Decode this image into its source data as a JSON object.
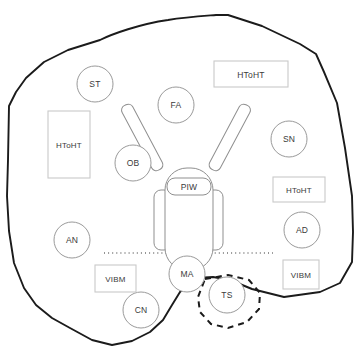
{
  "diagram": {
    "type": "spatial-zone-layout-diagram",
    "canvas": {
      "width": 361,
      "height": 359
    },
    "center_unit": {
      "name": "robot-platform",
      "label": "PIW",
      "parts": [
        "left-wheel",
        "right-wheel",
        "body",
        "head",
        "left-arm",
        "right-arm",
        "label-plate"
      ]
    },
    "circle_nodes": [
      {
        "id": "st",
        "label": "ST",
        "cx": 95,
        "cy": 84,
        "r": 18
      },
      {
        "id": "fa",
        "label": "FA",
        "cx": 176,
        "cy": 105,
        "r": 18
      },
      {
        "id": "ob",
        "label": "OB",
        "cx": 133,
        "cy": 163,
        "r": 18
      },
      {
        "id": "sn",
        "label": "SN",
        "cx": 289,
        "cy": 139,
        "r": 18
      },
      {
        "id": "an",
        "label": "AN",
        "cx": 72,
        "cy": 240,
        "r": 18
      },
      {
        "id": "ad",
        "label": "AD",
        "cx": 302,
        "cy": 230,
        "r": 18
      },
      {
        "id": "ma",
        "label": "MA",
        "cx": 187,
        "cy": 274,
        "r": 18
      },
      {
        "id": "ts",
        "label": "TS",
        "cx": 227,
        "cy": 295,
        "r": 18
      },
      {
        "id": "cn",
        "label": "CN",
        "cx": 141,
        "cy": 310,
        "r": 18
      }
    ],
    "box_nodes": [
      {
        "id": "htoht-top",
        "label": "HToHT",
        "x": 214,
        "y": 61,
        "w": 74,
        "h": 26
      },
      {
        "id": "htoht-left",
        "label": "HToHT",
        "x": 48,
        "y": 111,
        "w": 42,
        "h": 67
      },
      {
        "id": "htoht-right",
        "label": "HToHT",
        "x": 273,
        "y": 177,
        "w": 52,
        "h": 25
      },
      {
        "id": "vibm-left",
        "label": "VIBM",
        "x": 95,
        "y": 265,
        "w": 41,
        "h": 27
      },
      {
        "id": "vibm-right",
        "label": "VIBM",
        "x": 283,
        "y": 260,
        "w": 36,
        "h": 29
      }
    ],
    "divider": {
      "id": "dotted-divider",
      "style": "dotted",
      "x1": 104,
      "y1": 253,
      "x2": 273,
      "y2": 253
    },
    "highlight_region": {
      "id": "ts-dashed-region",
      "style": "dashed",
      "encloses": "ts"
    },
    "boundary": {
      "id": "outer-boundary",
      "style": "solid-polygon"
    },
    "colors": {
      "boundary_stroke": "#1b1b1b",
      "circle_stroke": "#9a9a9a",
      "box_stroke": "#c9c9c9",
      "robot_stroke": "#8f8f8f",
      "label_text": "#3a3a3a",
      "background": "#ffffff"
    }
  }
}
